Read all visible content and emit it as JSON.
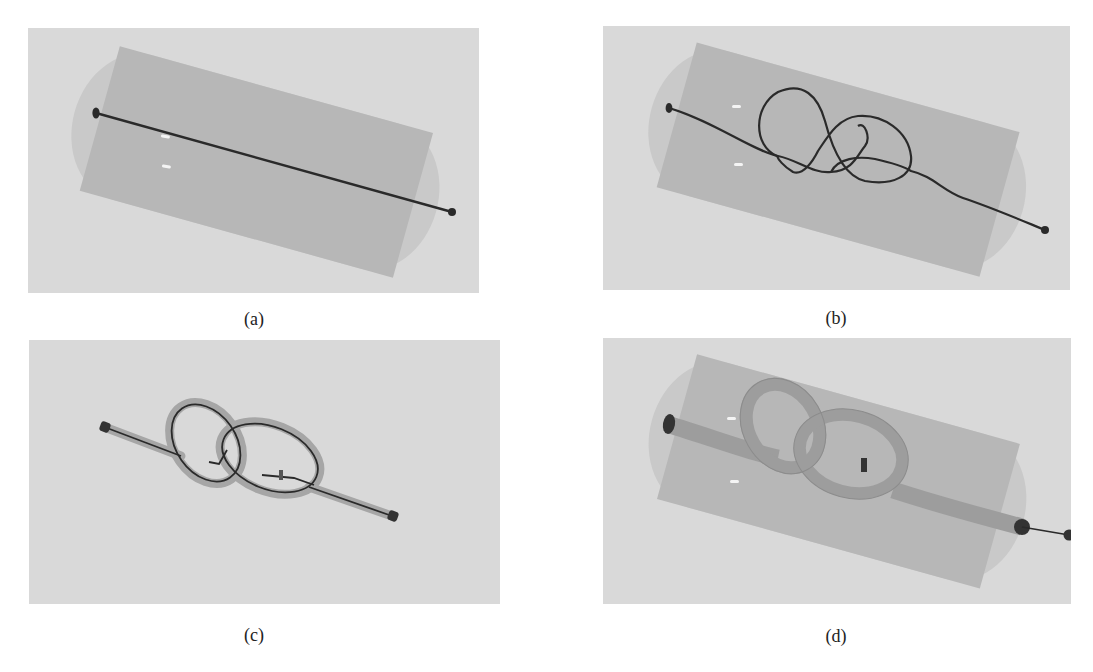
{
  "figure": {
    "panels": [
      {
        "id": "a",
        "caption": "(a)",
        "description": "Straight filament inside a transparent cylindrical container"
      },
      {
        "id": "b",
        "caption": "(b)",
        "description": "Filament tied into a knot inside the cylindrical container"
      },
      {
        "id": "c",
        "caption": "(c)",
        "description": "Knotted filament with a surrounding tube, container hidden"
      },
      {
        "id": "d",
        "caption": "(d)",
        "description": "Thick tube knot inside the cylindrical container with filament end protruding"
      }
    ]
  },
  "colors": {
    "background": "#d9d9d9",
    "cylinder_outer": "#c9c9c9",
    "cylinder_inner": "#b5b5b5",
    "filament": "#2a2a2a",
    "tube": "#9a9a9a",
    "highlight": "#f4f4f4"
  }
}
